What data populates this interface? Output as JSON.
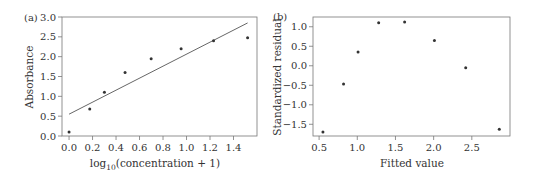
{
  "chart_data": [
    {
      "panel": "(a)",
      "type": "scatter",
      "xlabel": "log10(concentration + 1)",
      "xlabel_base": "log",
      "xlabel_sub": "10",
      "xlabel_rest": "(concentration + 1)",
      "ylabel": "Absorbance",
      "xlim": [
        -0.06,
        1.6
      ],
      "ylim": [
        0.0,
        3.0
      ],
      "xticks": [
        0.0,
        0.2,
        0.4,
        0.6,
        0.8,
        1.0,
        1.2,
        1.4
      ],
      "xtick_labels": [
        "0.0",
        "0.2",
        "0.4",
        "0.6",
        "0.8",
        "1.0",
        "1.2",
        "1.4"
      ],
      "yticks": [
        0.0,
        0.5,
        1.0,
        1.5,
        2.0,
        2.5,
        3.0
      ],
      "ytick_labels": [
        "0.0",
        "0.5",
        "1.0",
        "1.5",
        "2.0",
        "2.5",
        "3.0"
      ],
      "grid": false,
      "x": [
        0.0,
        0.176,
        0.301,
        0.477,
        0.699,
        0.954,
        1.23,
        1.52
      ],
      "y": [
        0.1,
        0.68,
        1.1,
        1.6,
        1.95,
        2.2,
        2.4,
        2.48
      ],
      "fit_line": {
        "x": [
          0.0,
          1.52
        ],
        "y": [
          0.55,
          2.85
        ]
      }
    },
    {
      "panel": "(b)",
      "type": "scatter",
      "xlabel": "Fitted value",
      "ylabel": "Standardized residual",
      "xlim": [
        0.42,
        3.0
      ],
      "ylim": [
        -1.8,
        1.25
      ],
      "xticks": [
        0.5,
        1.0,
        1.5,
        2.0,
        2.5
      ],
      "xtick_labels": [
        "0.5",
        "1.0",
        "1.5",
        "2.0",
        "2.5"
      ],
      "yticks": [
        -1.5,
        -1.0,
        -0.5,
        0.0,
        0.5,
        1.0
      ],
      "ytick_labels": [
        "−1.5",
        "−1.0",
        "−0.5",
        "0.0",
        "0.5",
        "1.0"
      ],
      "grid": false,
      "x": [
        0.55,
        0.82,
        1.01,
        1.28,
        1.62,
        2.01,
        2.42,
        2.86
      ],
      "y": [
        -1.7,
        -0.47,
        0.35,
        1.1,
        1.12,
        0.65,
        -0.05,
        -1.63
      ]
    }
  ],
  "colors": {
    "axis": "#777777",
    "marker": "#333333",
    "line": "#555555",
    "text": "#333333"
  }
}
